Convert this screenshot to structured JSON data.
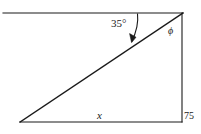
{
  "figure": {
    "type": "geometry-diagram",
    "background_color": "#ffffff",
    "stroke_color": "#1a1a1a"
  },
  "labels": {
    "angle_of_elevation": "35°",
    "top_right_angle": "ϕ",
    "base_label": "x",
    "vertical_side_label": "75"
  },
  "geometry": {
    "top_line": {
      "x1": 3,
      "y1": 13,
      "x2": 183,
      "y2": 13
    },
    "hypotenuse": {
      "x1": 20,
      "y1": 122,
      "x2": 183,
      "y2": 13
    },
    "base_line": {
      "x1": 20,
      "y1": 122,
      "x2": 182,
      "y2": 122
    },
    "vertical_line": {
      "x1": 182,
      "y1": 13,
      "x2": 182,
      "y2": 122
    },
    "arrow": {
      "start_x": 137,
      "start_y": 14,
      "end_x": 131,
      "end_y": 42
    }
  },
  "label_positions": {
    "angle_of_elevation": {
      "left": 111,
      "top": 18
    },
    "top_right_angle": {
      "left": 168,
      "top": 26
    },
    "base_label": {
      "left": 97,
      "top": 110
    },
    "vertical_side_label": {
      "left": 184,
      "top": 111
    }
  }
}
